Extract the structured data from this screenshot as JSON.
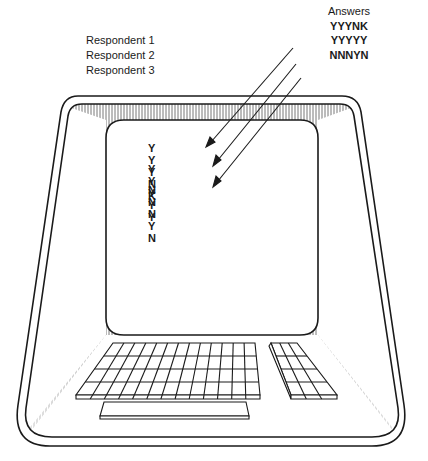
{
  "figure": {
    "respondents_label_list": [
      "Respondent 1",
      "Respondent 2",
      "Respondent 3"
    ],
    "answers": {
      "header": "Answers",
      "rows": [
        "YYYNK",
        "YYYYY",
        "NNNYN"
      ]
    },
    "screen": {
      "rows": [
        [
          "Y",
          "Y",
          "Y",
          "N",
          "K"
        ],
        [
          "Y",
          "Y",
          "Y",
          "Y",
          "Y"
        ],
        [
          "N",
          "N",
          "N",
          "Y",
          "N"
        ]
      ]
    },
    "terminal": {
      "keyboard": {
        "columns": 13,
        "rows": 4
      },
      "keypad": {
        "columns": 3,
        "rows": 4
      },
      "has_spacebar": true
    },
    "colors": {
      "ink": "#1a1a1a",
      "background": "#ffffff",
      "hatch": "#555555"
    }
  }
}
